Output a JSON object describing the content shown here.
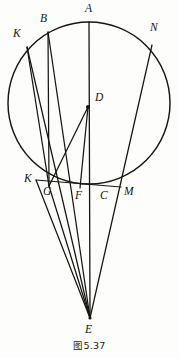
{
  "figure": {
    "caption": "图5.37",
    "stroke_color": "#17150f",
    "background_color": "#fdfdfc",
    "width": 179,
    "height": 358
  },
  "geometry": {
    "circle": {
      "cx": 89,
      "cy": 103,
      "r": 81
    },
    "points": {
      "A": {
        "x": 89,
        "y": 22,
        "label": "A",
        "label_x": 85,
        "label_y": 3
      },
      "B": {
        "x": 48,
        "y": 32,
        "label": "B",
        "label_x": 40,
        "label_y": 13
      },
      "K_top": {
        "x": 27,
        "y": 47,
        "label": "K",
        "label_x": 13,
        "label_y": 28
      },
      "N": {
        "x": 152,
        "y": 45,
        "label": "N",
        "label_x": 150,
        "label_y": 22
      },
      "D": {
        "x": 88,
        "y": 107,
        "label": "D",
        "label_x": 95,
        "label_y": 92
      },
      "K_bottom": {
        "x": 36,
        "y": 180,
        "label": "K",
        "label_x": 24,
        "label_y": 173
      },
      "G": {
        "x": 49,
        "y": 186,
        "label": "G",
        "label_x": 43,
        "label_y": 186
      },
      "F": {
        "x": 80,
        "y": 188,
        "label": "F",
        "label_x": 75,
        "label_y": 190
      },
      "C": {
        "x": 103,
        "y": 188,
        "label": "C",
        "label_x": 100,
        "label_y": 190
      },
      "M": {
        "x": 121,
        "y": 187,
        "label": "M",
        "label_x": 124,
        "label_y": 186
      },
      "E": {
        "x": 90,
        "y": 318,
        "label": "E",
        "label_x": 85,
        "label_y": 324
      }
    },
    "segments": [
      {
        "name": "chord-K-M",
        "from": "K_bottom",
        "to": "M"
      },
      {
        "name": "axis-A-E",
        "from": "A",
        "to": "E"
      },
      {
        "name": "segment-B-E",
        "from": "B",
        "to": "E"
      },
      {
        "name": "segment-B-G",
        "from": "B",
        "to": "G"
      },
      {
        "name": "segment-Ktop-G",
        "from": "K_top",
        "to": "G"
      },
      {
        "name": "segment-Ktop-E",
        "from": "K_top",
        "to": "E"
      },
      {
        "name": "segment-N-E",
        "from": "N",
        "to": "E"
      },
      {
        "name": "segment-D-G",
        "from": "D",
        "to": "G"
      },
      {
        "name": "segment-D-F",
        "from": "D",
        "to": "F"
      },
      {
        "name": "segment-Kbottom-E",
        "from": "K_bottom",
        "to": "E"
      },
      {
        "name": "segment-G-E",
        "from": "G",
        "to": "E"
      }
    ]
  }
}
